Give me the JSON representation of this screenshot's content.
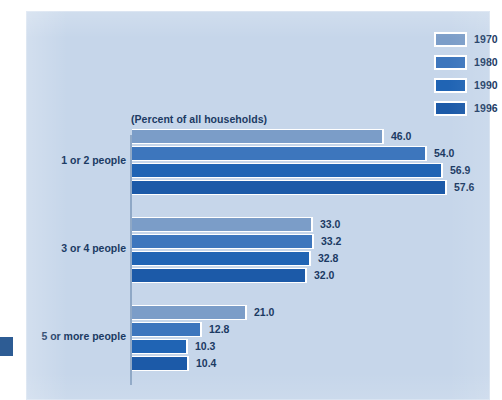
{
  "figure": {
    "subtitle": "(Percent of all households)",
    "background_color": "#c6d6ea",
    "text_color": "#1b3a63"
  },
  "legend": {
    "position": "top-right",
    "items": [
      {
        "label": "1970",
        "color": "#7b9dc8",
        "swatch_name": "legend-swatch-1970"
      },
      {
        "label": "1980",
        "color": "#3d76bd",
        "swatch_name": "legend-swatch-1980"
      },
      {
        "label": "1990",
        "color": "#2064b4",
        "swatch_name": "legend-swatch-1990"
      },
      {
        "label": "1996",
        "color": "#1c5aa8",
        "swatch_name": "legend-swatch-1996"
      }
    ]
  },
  "chart_data": {
    "type": "bar",
    "orientation": "horizontal",
    "title": "",
    "subtitle": "(Percent of all households)",
    "xlabel": "",
    "ylabel": "",
    "xlim": [
      0,
      60
    ],
    "grid": false,
    "legend_position": "top-right",
    "categories": [
      "1 or 2 people",
      "3 or 4 people",
      "5 or more people"
    ],
    "series": [
      {
        "name": "1970",
        "color": "#7b9dc8",
        "values": [
          46.0,
          33.0,
          21.0
        ]
      },
      {
        "name": "1980",
        "color": "#3d76bd",
        "values": [
          54.0,
          33.2,
          12.8
        ]
      },
      {
        "name": "1990",
        "color": "#2064b4",
        "values": [
          56.9,
          32.8,
          10.3
        ]
      },
      {
        "name": "1996",
        "color": "#1c5aa8",
        "values": [
          57.6,
          32.0,
          10.4
        ]
      }
    ],
    "value_labels": [
      [
        "46.0",
        "54.0",
        "56.9",
        "57.6"
      ],
      [
        "33.0",
        "33.2",
        "32.8",
        "32.0"
      ],
      [
        "21.0",
        "12.8",
        "10.3",
        "10.4"
      ]
    ]
  },
  "groups": [
    {
      "label": "1 or 2 people",
      "bars": [
        {
          "series": "1970",
          "value": 46.0,
          "label": "46.0",
          "color": "#7b9dc8"
        },
        {
          "series": "1980",
          "value": 54.0,
          "label": "54.0",
          "color": "#3d76bd"
        },
        {
          "series": "1990",
          "value": 56.9,
          "label": "56.9",
          "color": "#2064b4"
        },
        {
          "series": "1996",
          "value": 57.6,
          "label": "57.6",
          "color": "#1c5aa8"
        }
      ]
    },
    {
      "label": "3 or 4 people",
      "bars": [
        {
          "series": "1970",
          "value": 33.0,
          "label": "33.0",
          "color": "#7b9dc8"
        },
        {
          "series": "1980",
          "value": 33.2,
          "label": "33.2",
          "color": "#3d76bd"
        },
        {
          "series": "1990",
          "value": 32.8,
          "label": "32.8",
          "color": "#2064b4"
        },
        {
          "series": "1996",
          "value": 32.0,
          "label": "32.0",
          "color": "#1c5aa8"
        }
      ]
    },
    {
      "label": "5 or more people",
      "bars": [
        {
          "series": "1970",
          "value": 21.0,
          "label": "21.0",
          "color": "#7b9dc8"
        },
        {
          "series": "1980",
          "value": 12.8,
          "label": "12.8",
          "color": "#3d76bd"
        },
        {
          "series": "1990",
          "value": 10.3,
          "label": "10.3",
          "color": "#2064b4"
        },
        {
          "series": "1996",
          "value": 10.4,
          "label": "10.4",
          "color": "#1c5aa8"
        }
      ]
    }
  ]
}
